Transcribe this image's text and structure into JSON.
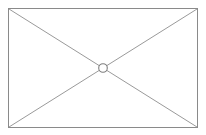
{
  "canvas": {
    "width": 206,
    "height": 135,
    "background_color": "#ffffff",
    "description": "broken-image placeholder graphic"
  },
  "graphic": {
    "name": "missing-image-placeholder",
    "kind": "vector-outline",
    "has_text": false,
    "frame": {
      "label": "outer-rectangle",
      "x": 8.5,
      "y": 8.5,
      "width": 189,
      "height": 119,
      "stroke_color": "#8a8a8a",
      "stroke_width": 1.2,
      "fill_color": "#ffffff"
    },
    "diagonals": [
      {
        "label": "diagonal-top-left-to-bottom-right",
        "x1": 9,
        "y1": 9,
        "x2": 197,
        "y2": 127,
        "stroke_color": "#9a9a9a",
        "stroke_width": 1
      },
      {
        "label": "diagonal-bottom-left-to-top-right",
        "x1": 9,
        "y1": 127,
        "x2": 197,
        "y2": 9,
        "stroke_color": "#9a9a9a",
        "stroke_width": 1
      }
    ],
    "center_marker": {
      "label": "center-circle",
      "cx": 103,
      "cy": 68,
      "r": 4.3,
      "stroke_color": "#7d7d7d",
      "stroke_width": 1.1,
      "fill_color": "#ffffff"
    }
  }
}
